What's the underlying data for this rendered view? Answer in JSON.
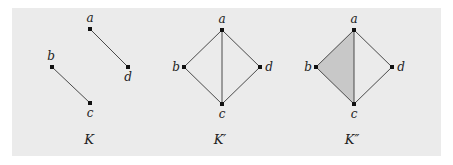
{
  "figure": {
    "background": "#ebebeb",
    "face_fill": "#c8c8c8",
    "complexes": [
      {
        "id": "K",
        "caption": "K",
        "vertices": [
          {
            "name": "a",
            "x": 90,
            "y": 29,
            "label_dx": 0,
            "label_dy": -7,
            "anchor": "middle"
          },
          {
            "name": "d",
            "x": 128,
            "y": 67,
            "label_dx": 0,
            "label_dy": 14,
            "anchor": "middle"
          },
          {
            "name": "b",
            "x": 52,
            "y": 67,
            "label_dx": -1,
            "label_dy": -7,
            "anchor": "middle"
          },
          {
            "name": "c",
            "x": 90,
            "y": 103,
            "label_dx": 0,
            "label_dy": 14,
            "anchor": "middle"
          }
        ],
        "edges": [
          [
            "a",
            "d"
          ],
          [
            "b",
            "c"
          ]
        ],
        "faces": [],
        "caption_x": 89
      },
      {
        "id": "K-prime",
        "caption": "K′",
        "vertices": [
          {
            "name": "a",
            "x": 222,
            "y": 30,
            "label_dx": 0,
            "label_dy": -7,
            "anchor": "middle"
          },
          {
            "name": "b",
            "x": 184,
            "y": 67,
            "label_dx": -8,
            "label_dy": 4,
            "anchor": "middle"
          },
          {
            "name": "d",
            "x": 260,
            "y": 67,
            "label_dx": 9,
            "label_dy": 4,
            "anchor": "middle"
          },
          {
            "name": "c",
            "x": 222,
            "y": 104,
            "label_dx": 0,
            "label_dy": 14,
            "anchor": "middle"
          }
        ],
        "edges": [
          [
            "a",
            "b"
          ],
          [
            "a",
            "c"
          ],
          [
            "a",
            "d"
          ],
          [
            "b",
            "c"
          ],
          [
            "c",
            "d"
          ]
        ],
        "faces": [],
        "caption_x": 220
      },
      {
        "id": "K-double-prime",
        "caption": "K″",
        "vertices": [
          {
            "name": "a",
            "x": 354,
            "y": 30,
            "label_dx": 0,
            "label_dy": -7,
            "anchor": "middle"
          },
          {
            "name": "b",
            "x": 316,
            "y": 67,
            "label_dx": -8,
            "label_dy": 4,
            "anchor": "middle"
          },
          {
            "name": "d",
            "x": 392,
            "y": 67,
            "label_dx": 9,
            "label_dy": 4,
            "anchor": "middle"
          },
          {
            "name": "c",
            "x": 354,
            "y": 104,
            "label_dx": 0,
            "label_dy": 14,
            "anchor": "middle"
          }
        ],
        "edges": [
          [
            "a",
            "b"
          ],
          [
            "a",
            "c"
          ],
          [
            "a",
            "d"
          ],
          [
            "b",
            "c"
          ],
          [
            "c",
            "d"
          ]
        ],
        "faces": [
          [
            "a",
            "b",
            "c"
          ]
        ],
        "caption_x": 352
      }
    ],
    "caption_y": 144
  }
}
